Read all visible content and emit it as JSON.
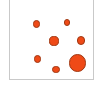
{
  "chart_data": {
    "type": "scatter",
    "title": "",
    "subtitle": "",
    "xlabel": "",
    "ylabel": "",
    "xlim": [
      0,
      100
    ],
    "ylim": [
      0,
      100
    ],
    "grid": false,
    "legend": null,
    "axis_ticks": {
      "x": [],
      "y": []
    },
    "annotations": [],
    "marker_fill": "#ef4a17",
    "marker_stroke": "#9e3813",
    "panel_border": "#c9c9c9",
    "panel_background": "#ffffff",
    "series": [
      {
        "name": "points",
        "points": [
          {
            "id": "point-1",
            "x": 31,
            "y": 76,
            "size": 5.4,
            "cx": 35.5,
            "cy": 23.0,
            "r": 3.7
          },
          {
            "id": "point-2",
            "x": 67,
            "y": 78,
            "size": 4.6,
            "cx": 66.0,
            "cy": 21.5,
            "r": 3.2
          },
          {
            "id": "point-3",
            "x": 52,
            "y": 55,
            "size": 7.0,
            "cx": 53.0,
            "cy": 40.0,
            "r": 4.6
          },
          {
            "id": "point-4",
            "x": 84,
            "y": 56,
            "size": 6.4,
            "cx": 80.0,
            "cy": 39.5,
            "r": 4.3
          },
          {
            "id": "point-5",
            "x": 33,
            "y": 33,
            "size": 5.8,
            "cx": 36.5,
            "cy": 58.0,
            "r": 3.9
          },
          {
            "id": "point-6",
            "x": 55,
            "y": 20,
            "size": 5.2,
            "cx": 55.0,
            "cy": 68.5,
            "r": 3.6
          },
          {
            "id": "point-7",
            "x": 79,
            "y": 30,
            "size": 15.0,
            "cx": 76.5,
            "cy": 62.0,
            "r": 8.6
          }
        ]
      }
    ]
  }
}
